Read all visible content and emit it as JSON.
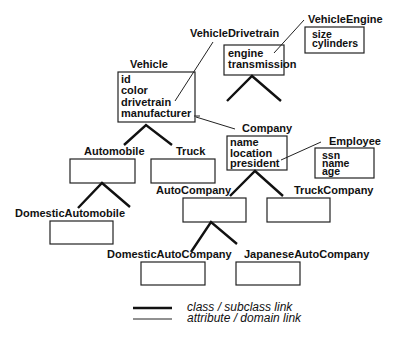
{
  "classes": {
    "vehicle": {
      "name": "Vehicle",
      "attributes": [
        "id",
        "color",
        "drivetrain",
        "manufacturer"
      ]
    },
    "vehicle_drivetrain": {
      "name": "VehicleDrivetrain",
      "attributes": [
        "engine",
        "transmission"
      ]
    },
    "vehicle_engine": {
      "name": "VehicleEngine",
      "attributes": [
        "size",
        "cylinders"
      ]
    },
    "company": {
      "name": "Company",
      "attributes": [
        "name",
        "location",
        "president"
      ]
    },
    "employee": {
      "name": "Employee",
      "attributes": [
        "ssn",
        "name",
        "age"
      ]
    },
    "automobile": {
      "name": "Automobile",
      "attributes": []
    },
    "truck": {
      "name": "Truck",
      "attributes": []
    },
    "domestic_automobile": {
      "name": "DomesticAutomobile",
      "attributes": []
    },
    "auto_company": {
      "name": "AutoCompany",
      "attributes": []
    },
    "truck_company": {
      "name": "TruckCompany",
      "attributes": []
    },
    "domestic_auto_company": {
      "name": "DomesticAutoCompany",
      "attributes": []
    },
    "japanese_auto_company": {
      "name": "JapaneseAutoCompany",
      "attributes": []
    }
  },
  "subclass_links": [
    {
      "parent": "Vehicle",
      "children": [
        "Automobile",
        "Truck"
      ]
    },
    {
      "parent": "Automobile",
      "children": [
        "DomesticAutomobile"
      ]
    },
    {
      "parent": "VehicleDrivetrain",
      "children": []
    },
    {
      "parent": "Company",
      "children": [
        "AutoCompany",
        "TruckCompany"
      ]
    },
    {
      "parent": "AutoCompany",
      "children": [
        "DomesticAutoCompany",
        "JapaneseAutoCompany"
      ]
    }
  ],
  "attribute_links": [
    {
      "from": "Vehicle.drivetrain",
      "to": "VehicleDrivetrain"
    },
    {
      "from": "Vehicle.manufacturer",
      "to": "Company"
    },
    {
      "from": "VehicleDrivetrain.engine",
      "to": "VehicleEngine"
    },
    {
      "from": "Company.president",
      "to": "Employee"
    }
  ],
  "legend": {
    "thick_label": "class / subclass link",
    "thin_label": "attribute / domain link"
  }
}
